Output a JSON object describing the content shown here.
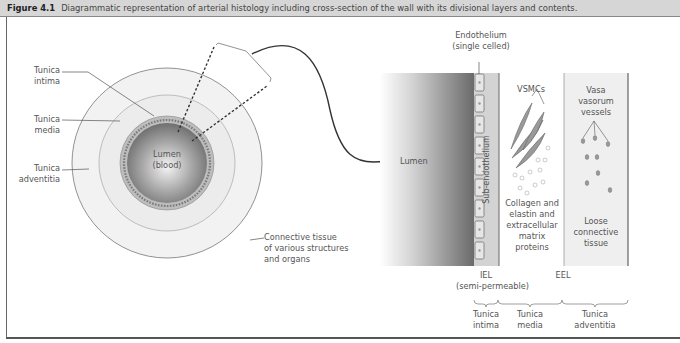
{
  "caption": {
    "figure_label": "Figure 4.1",
    "text": "Diagrammatic representation of arterial histology including cross-section of the wall with its divisional layers and contents."
  },
  "cross_section": {
    "labels": {
      "tunica_intima": [
        "Tunica",
        "intima"
      ],
      "tunica_media": [
        "Tunica",
        "media"
      ],
      "tunica_adventitia": [
        "Tunica",
        "adventitia"
      ],
      "lumen": [
        "Lumen",
        "(blood)"
      ],
      "connective_tissue": [
        "Connective tissue",
        "of various structures",
        "and organs"
      ]
    }
  },
  "wall_detail": {
    "lumen_label": "Lumen",
    "endothelium": [
      "Endothelium",
      "(single celled)"
    ],
    "subendothelium": "Sub-endothelium",
    "vsmcs": "VSMCs",
    "media_contents": [
      "Collagen and",
      "elastin and",
      "extracellular",
      "matrix",
      "proteins"
    ],
    "vasa_vasorum": [
      "Vasa",
      "vasorum",
      "vessels"
    ],
    "adventitia_contents": [
      "Loose",
      "connective",
      "tissue"
    ],
    "iel": [
      "IEL",
      "(semi-permeable)"
    ],
    "eel": "EEL",
    "layers": [
      [
        "Tunica",
        "intima"
      ],
      [
        "Tunica",
        "media"
      ],
      [
        "Tunica",
        "adventitia"
      ]
    ]
  },
  "colors": {
    "caption_bg": "#d6d6d6",
    "adventitia_fill": "#f1f1f1",
    "media_fill": "#ececec",
    "intima_ring": "#b9b9b9",
    "lumen_dark": "#6e6e6e",
    "subendo_fill": "#d4d4d4",
    "adventitia_band": "#efefef"
  }
}
